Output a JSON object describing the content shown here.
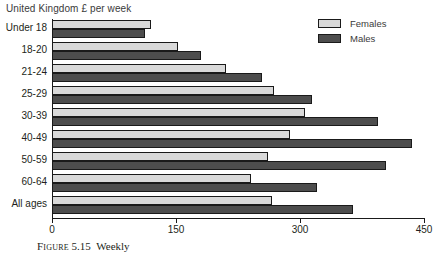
{
  "chart_data": {
    "type": "bar",
    "orientation": "horizontal",
    "title": "United Kingdom £ per week",
    "xlabel": "",
    "ylabel": "",
    "xlim": [
      0,
      450
    ],
    "xticks": [
      0,
      150,
      300,
      450
    ],
    "grid": false,
    "legend_position": "top-right",
    "categories": [
      "Under 18",
      "18-20",
      "21-24",
      "25-29",
      "30-39",
      "40-49",
      "50-59",
      "60-64",
      "All ages"
    ],
    "series": [
      {
        "name": "Females",
        "color": "#d9d9d9",
        "values": [
          120,
          152,
          210,
          268,
          306,
          288,
          261,
          241,
          266
        ]
      },
      {
        "name": "Males",
        "color": "#4d4d4d",
        "values": [
          112,
          180,
          254,
          314,
          394,
          436,
          404,
          320,
          364
        ]
      }
    ]
  },
  "caption": {
    "prefix": "Figure",
    "number": "5.15",
    "text": "Weekly"
  }
}
